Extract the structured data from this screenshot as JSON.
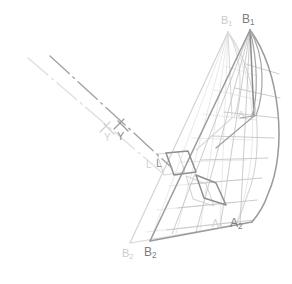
{
  "figure": {
    "background": "#ffffff",
    "width": 292,
    "height": 284,
    "colors": {
      "ghost": "#d9d9d9",
      "ghost_light": "#e2e2e2",
      "mesh_light": "#cfcfcf",
      "solid": "#9a9a9a",
      "solid_dark": "#8a8a8a",
      "mesh_dark": "#b4b4b4",
      "axis_light": "#dcdcdc",
      "axis_dark": "#9e9e9e",
      "label_ghost": "#cccccc",
      "label_solid": "#808080",
      "label_faint": "#c9c9c9"
    }
  },
  "labels": [
    {
      "id": "b1-ghost",
      "base": "B",
      "sub": "1",
      "x": 221,
      "y": 15,
      "size": 11,
      "color": "#cbcbcb",
      "weight": "normal"
    },
    {
      "id": "b1-solid",
      "base": "B",
      "sub": "1",
      "x": 242,
      "y": 13,
      "size": 12,
      "color": "#7d7d7d",
      "weight": "normal"
    },
    {
      "id": "a1-faint",
      "base": "A",
      "sub": "1",
      "x": 238,
      "y": 110,
      "size": 9,
      "color": "#c4c4c4",
      "weight": "normal"
    },
    {
      "id": "y-ghost",
      "base": "Y",
      "sub": "",
      "x": 104,
      "y": 133,
      "size": 10,
      "color": "#d2d2d2",
      "weight": "normal"
    },
    {
      "id": "y-solid",
      "base": "Y",
      "sub": "",
      "x": 117,
      "y": 131,
      "size": 11,
      "color": "#8f8f8f",
      "weight": "normal"
    },
    {
      "id": "l-ghost",
      "base": "L",
      "sub": "",
      "x": 146,
      "y": 160,
      "size": 10,
      "color": "#d2d2d2",
      "weight": "normal"
    },
    {
      "id": "l-solid",
      "base": "L",
      "sub": "",
      "x": 156,
      "y": 158,
      "size": 11,
      "color": "#8f8f8f",
      "weight": "normal"
    },
    {
      "id": "a2-ghost",
      "base": "A",
      "sub": "2",
      "x": 212,
      "y": 219,
      "size": 10,
      "color": "#cfcfcf",
      "weight": "normal"
    },
    {
      "id": "a2-solid",
      "base": "A",
      "sub": "2",
      "x": 230,
      "y": 217,
      "size": 12,
      "color": "#7d7d7d",
      "weight": "normal"
    },
    {
      "id": "b2-ghost",
      "base": "B",
      "sub": "2",
      "x": 122,
      "y": 248,
      "size": 11,
      "color": "#cbcbcb",
      "weight": "normal"
    },
    {
      "id": "b2-solid",
      "base": "B",
      "sub": "2",
      "x": 144,
      "y": 246,
      "size": 12,
      "color": "#7d7d7d",
      "weight": "normal"
    }
  ],
  "geometry": {
    "ghost_surface": {
      "apex_top": [
        228,
        32
      ],
      "apex_bottom": [
        130,
        243
      ],
      "tack": [
        236,
        225
      ],
      "clew_curve_ctrl": [
        268,
        120
      ],
      "note": "light grey duplicate of the surface, offset left and slightly up"
    },
    "solid_surface": {
      "apex_top": [
        250,
        30
      ],
      "apex_bottom": [
        150,
        241
      ],
      "tack": [
        252,
        222
      ],
      "clew_curve_ctrl": [
        286,
        118
      ],
      "note": "darker grey primary surface with luff, leech and foot"
    },
    "axis": {
      "light_from": [
        28,
        58
      ],
      "light_to": [
        166,
        176
      ],
      "dark_from": [
        50,
        56
      ],
      "dark_to": [
        172,
        168
      ],
      "style": "dash-dot"
    }
  }
}
